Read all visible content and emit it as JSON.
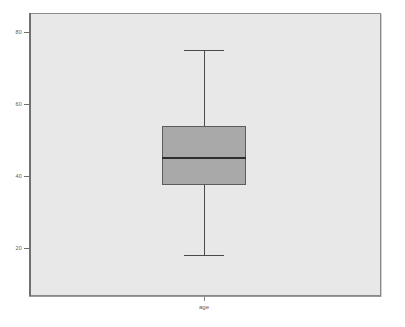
{
  "chart_data": {
    "type": "box",
    "title": "",
    "xlabel": "",
    "ylabel": "",
    "categories": [
      "age"
    ],
    "ylim": [
      12,
      85
    ],
    "grid": false,
    "legend": false,
    "y_ticks": [
      {
        "value": 80,
        "label": "80"
      },
      {
        "value": 60,
        "label": "60"
      },
      {
        "value": 40,
        "label": "40"
      },
      {
        "value": 20,
        "label": "20"
      }
    ],
    "boxes": [
      {
        "name": "age",
        "whisker_high": 75,
        "q3": 54,
        "median": 45,
        "q1": 37.5,
        "whisker_low": 18,
        "outliers": []
      }
    ],
    "colors": {
      "panel_background": "#e8e8e8",
      "figure_background": "#ffffff",
      "box_fill": "#a9a9a9",
      "box_border": "#5c5c5c",
      "median": "#2e2e2e",
      "whisker": "#4a4a4a",
      "axis": "#707070",
      "tick_label": "#5a5a5a"
    }
  },
  "axes": {
    "x_tick_label": "age"
  }
}
